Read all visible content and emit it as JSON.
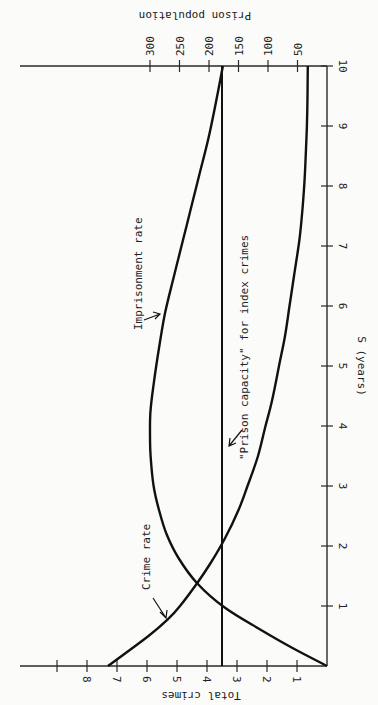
{
  "chart_data": {
    "type": "line",
    "orientation": "rotated 90 degrees counter-clockwise",
    "title": "",
    "xlabel": "S (years)",
    "ylabel": "Total crimes",
    "y2label": "Prison population",
    "xlim": [
      0,
      10
    ],
    "ylim": [
      0,
      9
    ],
    "y2lim": [
      0,
      300
    ],
    "x_ticks": [
      "1",
      "2",
      "3",
      "4",
      "5",
      "6",
      "7",
      "8",
      "9",
      "10"
    ],
    "y_ticks": [
      "1",
      "2",
      "3",
      "4",
      "5",
      "6",
      "7",
      "8"
    ],
    "y2_ticks": [
      "50",
      "100",
      "150",
      "200",
      "250",
      "300"
    ],
    "grid": false,
    "series": [
      {
        "name": "Crime rate",
        "x": [
          0,
          0.5,
          0.78,
          1.0,
          1.38,
          1.7,
          2.13,
          2.6,
          3.0,
          3.5,
          4.0,
          4.43,
          5.0,
          5.5,
          6.0,
          6.5,
          7.1,
          7.6,
          8.0,
          8.5,
          9.0,
          9.5,
          10.0
        ],
        "values": [
          7.3,
          5.95,
          5.3,
          4.9,
          4.33,
          3.9,
          3.4,
          2.95,
          2.65,
          2.3,
          2.05,
          1.83,
          1.6,
          1.4,
          1.25,
          1.1,
          0.92,
          0.82,
          0.76,
          0.71,
          0.67,
          0.65,
          0.64
        ]
      },
      {
        "name": "Imprisonment rate",
        "x": [
          0,
          0.3,
          0.6,
          0.97,
          1.38,
          1.8,
          2.2,
          2.6,
          3.0,
          3.5,
          3.88,
          4.27,
          4.8,
          5.3,
          5.88,
          6.5,
          7.1,
          7.6,
          8.2,
          8.8,
          9.4,
          10.0
        ],
        "values": [
          0,
          1.15,
          2.2,
          3.4,
          4.33,
          4.95,
          5.35,
          5.6,
          5.78,
          5.88,
          5.9,
          5.88,
          5.75,
          5.6,
          5.4,
          5.1,
          4.8,
          4.55,
          4.25,
          3.95,
          3.7,
          3.47
        ]
      },
      {
        "name": "\"Prison capacity\" for index crimes",
        "x": [
          0,
          10
        ],
        "values": [
          3.5,
          3.5
        ]
      }
    ],
    "annotations": [
      {
        "text": "Crime rate",
        "points_to": "Crime rate"
      },
      {
        "text": "Imprisonment rate",
        "points_to": "Imprisonment rate"
      },
      {
        "text": "\"Prison capacity\" for index crimes",
        "points_to": "\"Prison capacity\" for index crimes"
      }
    ]
  }
}
